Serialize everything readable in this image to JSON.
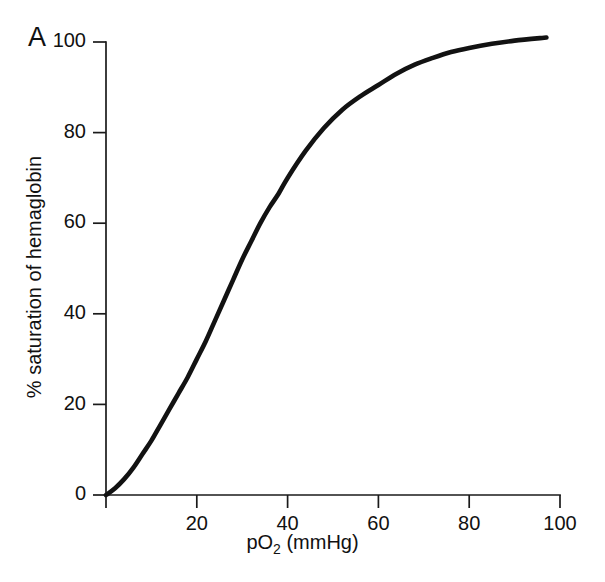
{
  "figure": {
    "panel_label": "A",
    "background_color": "#ffffff",
    "curve_color": "#121212",
    "axis_color": "#1a1a1a"
  },
  "chart_data": {
    "type": "line",
    "title": "",
    "subtitle": "",
    "panel": "A",
    "xlabel": "pO2 (mmHg)",
    "xlabel_display": "pO",
    "xlabel_subscript": "2",
    "xlabel_suffix": " (mmHg)",
    "ylabel": "% saturation of hemaglobin",
    "xlim": [
      0,
      100
    ],
    "ylim": [
      0,
      105
    ],
    "xticks": [
      0,
      20,
      40,
      60,
      80,
      100
    ],
    "xtick_labels": [
      "0",
      "20",
      "40",
      "60",
      "80",
      "100"
    ],
    "yticks": [
      0,
      20,
      40,
      60,
      80,
      100
    ],
    "ytick_labels": [
      "0",
      "20",
      "40",
      "60",
      "80",
      "100"
    ],
    "grid": false,
    "legend": false,
    "legend_position": "none",
    "tick_direction": "out",
    "series": [
      {
        "name": "oxygen-hemoglobin dissociation curve",
        "x": [
          0,
          2,
          4,
          6,
          8,
          10,
          12,
          14,
          16,
          18,
          20,
          22,
          24,
          26,
          28,
          30,
          32,
          34,
          36,
          38,
          40,
          44,
          48,
          52,
          56,
          60,
          64,
          68,
          72,
          76,
          80,
          85,
          90,
          97
        ],
        "values": [
          0,
          1.5,
          3.5,
          6,
          9,
          12,
          15.5,
          19,
          22.5,
          26,
          30,
          34,
          38.5,
          43,
          47.5,
          52,
          56,
          60,
          63.5,
          66.5,
          70,
          76,
          81,
          85,
          88,
          90.5,
          93,
          95,
          96.5,
          97.8,
          98.7,
          99.6,
          100.3,
          101
        ]
      }
    ],
    "annotations": []
  }
}
